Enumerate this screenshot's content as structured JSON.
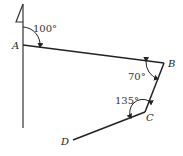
{
  "diagram": {
    "points": {
      "A": {
        "label": "A"
      },
      "B": {
        "label": "B"
      },
      "C": {
        "label": "C"
      },
      "D": {
        "label": "D"
      }
    },
    "angles": {
      "at_A": "100°",
      "at_B": "70°",
      "at_C": "135°"
    },
    "north_marker": "north-arrow"
  }
}
